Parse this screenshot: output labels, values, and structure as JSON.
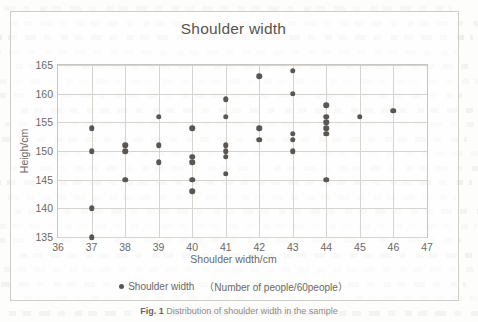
{
  "chart_data": {
    "type": "scatter",
    "title": "Shoulder width",
    "xlabel": "Shoulder width/cm",
    "ylabel": "Heigh/cm",
    "xlim": [
      36,
      47
    ],
    "ylim": [
      135,
      165
    ],
    "xticks": [
      36,
      37,
      38,
      39,
      40,
      41,
      42,
      43,
      44,
      45,
      46,
      47
    ],
    "yticks": [
      135,
      140,
      145,
      150,
      155,
      160,
      165
    ],
    "grid": true,
    "legend_position": "bottom",
    "series": [
      {
        "name": "Shoulder width",
        "legend_note": "（Number of people/60people）",
        "color": "#595653",
        "points": [
          [
            37,
            154
          ],
          [
            37,
            150
          ],
          [
            37,
            140
          ],
          [
            37,
            135
          ],
          [
            38,
            151
          ],
          [
            38,
            150
          ],
          [
            38,
            145
          ],
          [
            39,
            156
          ],
          [
            39,
            151
          ],
          [
            39,
            148
          ],
          [
            40,
            154
          ],
          [
            40,
            149
          ],
          [
            40,
            148
          ],
          [
            40,
            145
          ],
          [
            40,
            143
          ],
          [
            41,
            159
          ],
          [
            41,
            156
          ],
          [
            41,
            151
          ],
          [
            41,
            150
          ],
          [
            41,
            149
          ],
          [
            41,
            146
          ],
          [
            42,
            163
          ],
          [
            42,
            154
          ],
          [
            42,
            152
          ],
          [
            43,
            164
          ],
          [
            43,
            160
          ],
          [
            43,
            153
          ],
          [
            43,
            152
          ],
          [
            43,
            150
          ],
          [
            44,
            158
          ],
          [
            44,
            156
          ],
          [
            44,
            155
          ],
          [
            44,
            154
          ],
          [
            44,
            153
          ],
          [
            44,
            145
          ],
          [
            45,
            156
          ],
          [
            46,
            157
          ]
        ]
      }
    ]
  },
  "legend": {
    "label": "Shoulder width",
    "note": "（Number of people/60people）"
  },
  "caption": {
    "figure_number": "Fig. 1",
    "text": "Distribution of shoulder width in the sample"
  }
}
